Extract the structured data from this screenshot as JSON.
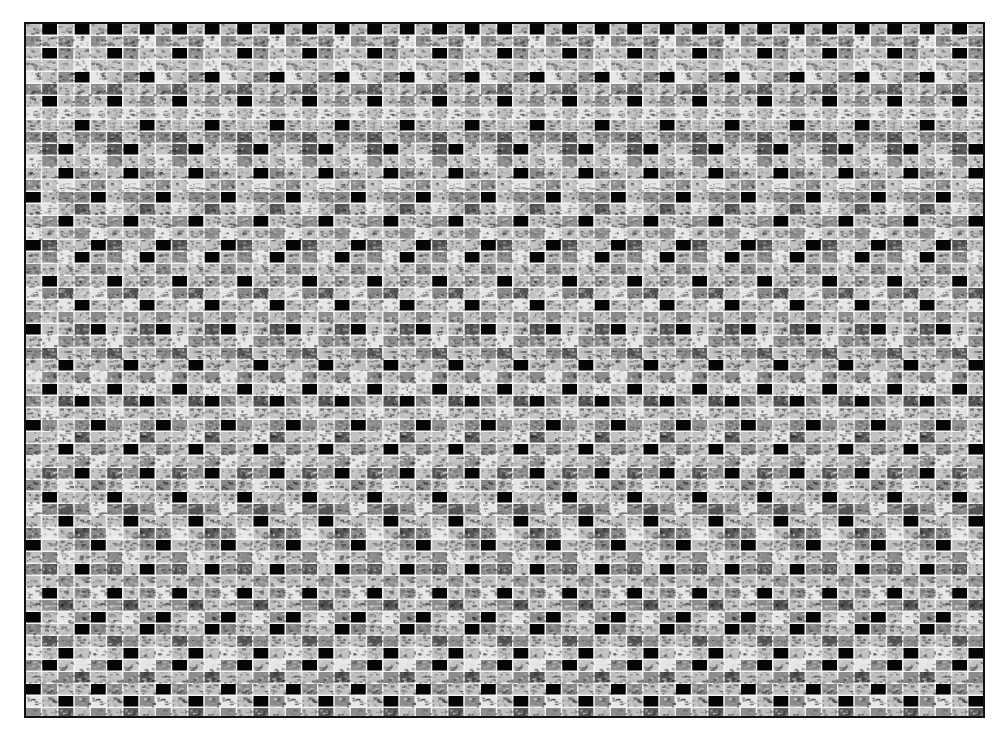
{
  "mosaic": {
    "left": 24,
    "top": 22,
    "width": 961,
    "height": 696,
    "border_color": "#111111",
    "gap_color": "#f4f4f4",
    "tile_width": 16.25,
    "tile_height": 12,
    "gap": 1.5,
    "period_columns": 4,
    "tones": {
      "K": "#050505",
      "D": "#555555",
      "M": "#8c8c8c",
      "L": "#c2c2c2",
      "W": "#e6e6e6"
    },
    "period_rows": [
      "LKLK",
      "MLMW",
      "LKML",
      "LLLW",
      "WLMK",
      "MDLL",
      "LKLM",
      "WLWL",
      "LLLK",
      "MDLM",
      "LDKL",
      "WMLL",
      "LLKM",
      "MLWL",
      "KLMM",
      "LWLD",
      "LMKL",
      "WLLM",
      "KDLL",
      "LMWK",
      "MLLL",
      "LKLM",
      "WMDL",
      "LLWK",
      "MLML",
      "KLLD",
      "LWMM",
      "MDLL",
      "LLKL",
      "WMLM",
      "LKLW",
      "MLDK",
      "LWLL",
      "KMLM",
      "LLWD",
      "MLKL",
      "WLLM",
      "LDMK",
      "MLWL",
      "LKLL",
      "WMDM",
      "LLKL",
      "MWLD",
      "KLLM",
      "LMWL",
      "MDLK",
      "LLML",
      "WKLM",
      "LMDL",
      "KLWM",
      "MLLK",
      "LDML",
      "WLKL",
      "MKLW",
      "LLMD",
      "KMLL",
      "WLKM",
      "MLDL"
    ]
  }
}
